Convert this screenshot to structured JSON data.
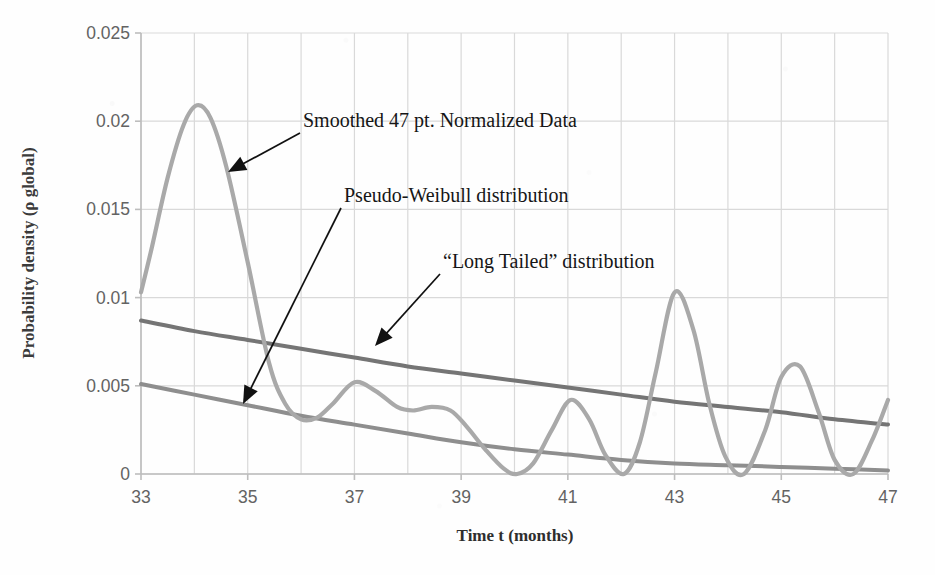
{
  "chart_data": {
    "type": "line",
    "title": "",
    "xlabel": "Time t (months)",
    "ylabel": "Probability density (ρ global)",
    "xlim": [
      33,
      47
    ],
    "ylim": [
      0,
      0.025
    ],
    "xticks": [
      "33",
      "35",
      "37",
      "39",
      "41",
      "43",
      "45",
      "47"
    ],
    "xtick_values": [
      33,
      35,
      37,
      39,
      41,
      43,
      45,
      47
    ],
    "yticks": [
      "0",
      "0.005",
      "0.01",
      "0.015",
      "0.02",
      "0.025"
    ],
    "ytick_values": [
      0,
      0.005,
      0.01,
      0.015,
      0.02,
      0.025
    ],
    "grid": true,
    "grid_axis": "both",
    "legend": "none",
    "legend_position": "annotations-with-arrows",
    "series": [
      {
        "name": "Smoothed 47 pt. Normalized Data",
        "color": "#a9a9a9",
        "width": 4.2,
        "x": [
          33.0,
          33.2,
          33.5,
          33.8,
          34.05,
          34.3,
          34.6,
          35.0,
          35.4,
          35.7,
          36.0,
          36.3,
          36.6,
          37.0,
          37.4,
          37.8,
          38.1,
          38.45,
          38.8,
          39.1,
          39.45,
          39.8,
          40.05,
          40.35,
          40.7,
          41.05,
          41.4,
          41.7,
          42.05,
          42.35,
          42.65,
          43.0,
          43.35,
          43.65,
          43.95,
          44.3,
          44.7,
          45.0,
          45.35,
          45.7,
          46.0,
          46.35,
          46.7,
          47.0
        ],
        "y": [
          0.0103,
          0.0128,
          0.0168,
          0.0198,
          0.0209,
          0.0202,
          0.0174,
          0.012,
          0.0063,
          0.004,
          0.0031,
          0.0032,
          0.004,
          0.0052,
          0.0047,
          0.0038,
          0.0036,
          0.0038,
          0.0036,
          0.0027,
          0.0014,
          0.0003,
          0.0,
          0.0006,
          0.0025,
          0.0042,
          0.0031,
          0.0011,
          0.0,
          0.0018,
          0.0058,
          0.0103,
          0.0082,
          0.004,
          0.001,
          0.0,
          0.0025,
          0.0055,
          0.0061,
          0.0035,
          0.0008,
          0.0,
          0.0019,
          0.0042
        ]
      },
      {
        "name": "“Long Tailed” distribution",
        "color": "#757575",
        "width": 4.0,
        "x": [
          33,
          34,
          35,
          36,
          37,
          38,
          39,
          40,
          41,
          42,
          43,
          44,
          45,
          46,
          47
        ],
        "y": [
          0.0087,
          0.0081,
          0.0076,
          0.0071,
          0.0066,
          0.0061,
          0.0057,
          0.0053,
          0.0049,
          0.0045,
          0.0041,
          0.0038,
          0.0035,
          0.0031,
          0.0028
        ]
      },
      {
        "name": "Pseudo-Weibull distribution",
        "color": "#8e8e8e",
        "width": 4.0,
        "x": [
          33,
          34,
          35,
          36,
          37,
          38,
          39,
          40,
          41,
          42,
          43,
          44,
          45,
          46,
          47
        ],
        "y": [
          0.0051,
          0.0045,
          0.0039,
          0.0033,
          0.0028,
          0.0023,
          0.0018,
          0.0014,
          0.0011,
          0.0008,
          0.0006,
          0.0005,
          0.0004,
          0.0003,
          0.0002
        ]
      }
    ],
    "annotations": [
      {
        "id": "smoothed-data",
        "text": "Smoothed 47 pt. Normalized Data",
        "text_x": 303,
        "text_y": 127,
        "arrow_from_x": 300,
        "arrow_from_y": 133,
        "arrow_to_x": 228,
        "arrow_to_y": 172
      },
      {
        "id": "pseudo-weibull",
        "text": "Pseudo-Weibull distribution",
        "text_x": 344,
        "text_y": 202,
        "arrow_from_x": 341,
        "arrow_from_y": 208,
        "arrow_to_x": 243,
        "arrow_to_y": 404
      },
      {
        "id": "long-tailed",
        "text": "“Long Tailed” distribution",
        "text_x": 443,
        "text_y": 268,
        "arrow_from_x": 440,
        "arrow_from_y": 274,
        "arrow_to_x": 375,
        "arrow_to_y": 346
      }
    ],
    "colors": {
      "grid": "#d9d9d9",
      "axis": "#bdbdbd",
      "tick_text": "#636363",
      "axis_label": "#2e2e2e",
      "annotation_text": "#161616",
      "arrow": "#111111",
      "background": "#fefefe"
    }
  }
}
